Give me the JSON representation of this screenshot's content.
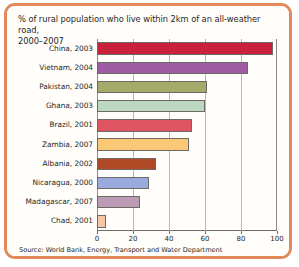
{
  "chart_data": {
    "type": "bar",
    "orientation": "horizontal",
    "title": "% of rural population who live within 2km of an all-weather road, 2000–2007",
    "title_line1": "% of rural population who live within 2km of an all-weather road,",
    "title_line2": "2000–2007",
    "source": "Source: World Bank, Energy, Transport and Water Department",
    "xlabel": "",
    "ylabel": "",
    "xlim": [
      0,
      100
    ],
    "xticks": [
      0,
      20,
      40,
      60,
      80,
      100
    ],
    "xticklabels": [
      "0",
      "20",
      "40",
      "60",
      "80",
      "100"
    ],
    "grid": true,
    "grid_axis": "x",
    "legend": "none",
    "categories": [
      "China, 2003",
      "Vietnam, 2004",
      "Pakistan, 2004",
      "Ghana, 2003",
      "Brazil, 2001",
      "Zambia, 2007",
      "Albania, 2002",
      "Nicaragua, 2000",
      "Madagascar, 2007",
      "Chad, 2001"
    ],
    "values": [
      98,
      84,
      61,
      60,
      53,
      51,
      33,
      29,
      24,
      5
    ],
    "bar_colors": [
      "#c9203c",
      "#a05ba5",
      "#a3ab6a",
      "#bcd8c0",
      "#e05563",
      "#fbc877",
      "#b04a26",
      "#9aaade",
      "#bb9cb4",
      "#fac4a6"
    ],
    "bars": [
      {
        "label": "China, 2003",
        "value": 98,
        "color": "#c9203c"
      },
      {
        "label": "Vietnam, 2004",
        "value": 84,
        "color": "#a05ba5"
      },
      {
        "label": "Pakistan, 2004",
        "value": 61,
        "color": "#a3ab6a"
      },
      {
        "label": "Ghana, 2003",
        "value": 60,
        "color": "#bcd8c0"
      },
      {
        "label": "Brazil, 2001",
        "value": 53,
        "color": "#e05563"
      },
      {
        "label": "Zambia, 2007",
        "value": 51,
        "color": "#fbc877"
      },
      {
        "label": "Albania, 2002",
        "value": 33,
        "color": "#b04a26"
      },
      {
        "label": "Nicaragua, 2000",
        "value": 29,
        "color": "#9aaade"
      },
      {
        "label": "Madagascar, 2007",
        "value": 24,
        "color": "#bb9cb4"
      },
      {
        "label": "Chad, 2001",
        "value": 5,
        "color": "#fac4a6"
      }
    ]
  },
  "frame": {
    "border_color": "#e2895a",
    "background_color": "#fffefb"
  }
}
